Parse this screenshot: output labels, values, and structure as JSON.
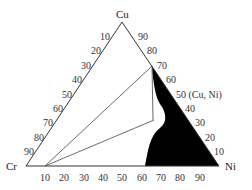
{
  "diagram": {
    "type": "ternary-phase-diagram",
    "vertices": {
      "top": "Cu",
      "left": "Cr",
      "right": "Ni"
    },
    "left_edge_ticks": [
      "10",
      "20",
      "30",
      "40",
      "50",
      "60",
      "70",
      "80",
      "90"
    ],
    "right_edge_ticks": [
      "90",
      "80",
      "70",
      "60",
      "50 (Cu, Ni)",
      "40",
      "30",
      "20",
      "10"
    ],
    "bottom_edge_ticks": [
      "10",
      "20",
      "30",
      "40",
      "50",
      "60",
      "70",
      "80",
      "90"
    ],
    "region_label": "(Cu, Ni)",
    "region_fill": "#000000",
    "line_color": "#333333"
  }
}
